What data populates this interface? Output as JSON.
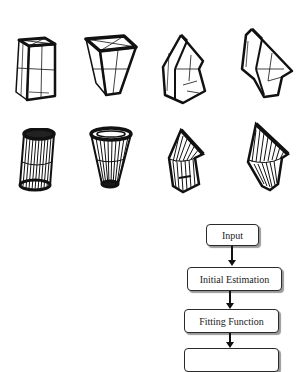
{
  "figure": {
    "shape_rows": [
      {
        "name": "polyhedral-models",
        "shapes": [
          {
            "id": "box-straight",
            "label": "rectangular block"
          },
          {
            "id": "box-tapered",
            "label": "tapered block"
          },
          {
            "id": "box-bent",
            "label": "bent block"
          },
          {
            "id": "box-bent-tapered",
            "label": "bent tapered block"
          }
        ]
      },
      {
        "name": "cylindrical-models",
        "shapes": [
          {
            "id": "cylinder-straight",
            "label": "cylinder"
          },
          {
            "id": "cylinder-tapered",
            "label": "tapered cylinder"
          },
          {
            "id": "cylinder-bent",
            "label": "bent cylinder"
          },
          {
            "id": "cylinder-bent-tapered",
            "label": "bent tapered cylinder"
          }
        ]
      }
    ],
    "flowchart": {
      "steps": [
        {
          "label": "Input"
        },
        {
          "label": "Initial Estimation"
        },
        {
          "label": "Fitting Function"
        },
        {
          "label": ""
        }
      ]
    }
  }
}
